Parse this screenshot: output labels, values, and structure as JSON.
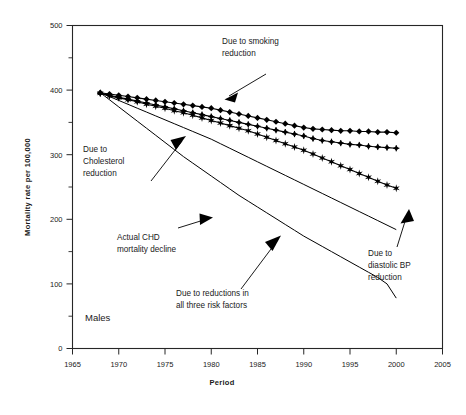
{
  "chart_data": {
    "type": "line",
    "title": "",
    "xlabel": "Period",
    "ylabel": "Mortality rate per 100,000",
    "panel_label": "Males",
    "xlim": [
      1965,
      2005
    ],
    "ylim": [
      0,
      500
    ],
    "xticks": [
      1965,
      1970,
      1975,
      1980,
      1985,
      1990,
      1995,
      2000,
      2005
    ],
    "xticklabels": [
      "1965",
      "1970",
      "1975",
      "1980",
      "1985",
      "1990",
      "1995",
      "2000",
      "2005"
    ],
    "yticks": [
      0,
      100,
      200,
      300,
      400,
      500
    ],
    "yticklabels": [
      "0",
      "100",
      "200",
      "300",
      "400",
      "500"
    ],
    "yminorticks": [
      50,
      150,
      250,
      350,
      450
    ],
    "grid": false,
    "legend_position": "none",
    "annotations": [
      {
        "text": "Due to smoking\nreduction",
        "line1": "Due to smoking",
        "line2": "reduction"
      },
      {
        "text": "Due to\nCholesterol\nreduction",
        "line1": "Due to",
        "line2": "Cholesterol",
        "line3": "reduction"
      },
      {
        "text": "Actual CHD\nmortality decline",
        "line1": "Actual CHD",
        "line2": "mortality decline"
      },
      {
        "text": "Due to reductions in\nall three risk factors",
        "line1": "Due to reductions in",
        "line2": "all three risk factors"
      },
      {
        "text": "Due to\ndiastolic BP\nreduction",
        "line1": "Due to",
        "line2": "diastolic BP",
        "line3": "reduction"
      }
    ],
    "x": [
      1968,
      1969,
      1970,
      1971,
      1972,
      1973,
      1974,
      1975,
      1976,
      1977,
      1978,
      1979,
      1980,
      1981,
      1982,
      1983,
      1984,
      1985,
      1986,
      1987,
      1988,
      1989,
      1990,
      1991,
      1992,
      1993,
      1994,
      1995,
      1996,
      1997,
      1998,
      1999,
      2000
    ],
    "series": [
      {
        "name": "Due to smoking reduction",
        "marker": "diamond",
        "values": [
          396,
          394,
          392,
          390,
          388,
          386,
          384,
          382,
          380,
          378,
          376,
          374,
          372,
          369,
          366,
          363,
          360,
          357,
          354,
          351,
          348,
          345,
          342,
          340,
          339,
          338,
          337,
          337,
          336,
          336,
          335,
          335,
          334
        ]
      },
      {
        "name": "Due to Cholesterol reduction",
        "marker": "diamond-plus",
        "values": [
          395,
          392,
          389,
          386,
          383,
          380,
          377,
          374,
          371,
          368,
          365,
          362,
          359,
          356,
          353,
          350,
          347,
          344,
          341,
          338,
          335,
          332,
          329,
          325,
          322,
          320,
          318,
          316,
          315,
          313,
          312,
          311,
          310
        ]
      },
      {
        "name": "Due to diastolic BP reduction",
        "marker": "star",
        "values": [
          395,
          391,
          388,
          385,
          382,
          378,
          375,
          372,
          368,
          365,
          361,
          357,
          353,
          349,
          345,
          341,
          337,
          332,
          327,
          322,
          317,
          312,
          307,
          301,
          295,
          289,
          283,
          277,
          271,
          265,
          259,
          253,
          248
        ]
      },
      {
        "name": "Actual CHD mortality decline",
        "marker": "none",
        "values": [
          396,
          385,
          374,
          363,
          352,
          341,
          330,
          319,
          308,
          297,
          287,
          277,
          267,
          257,
          247,
          237,
          228,
          219,
          210,
          201,
          192,
          183,
          174,
          166,
          158,
          150,
          142,
          134,
          126,
          118,
          110,
          100,
          78
        ]
      },
      {
        "name": "Due to reductions in all three risk factors",
        "marker": "none",
        "values": [
          396,
          390,
          384,
          378,
          372,
          366,
          360,
          354,
          348,
          342,
          336,
          330,
          324,
          317,
          310,
          303,
          296,
          289,
          282,
          275,
          268,
          261,
          254,
          247,
          240,
          233,
          226,
          219,
          212,
          205,
          198,
          191,
          184
        ]
      }
    ]
  }
}
